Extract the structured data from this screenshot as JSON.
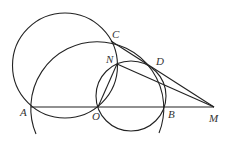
{
  "figure": {
    "type": "geometry-diagram",
    "stroke_color": "#222222",
    "label_color": "#333333",
    "points": {
      "A": {
        "label": "A",
        "x": 31,
        "y": 107,
        "lx": 20,
        "ly": 116
      },
      "O": {
        "label": "O",
        "x": 98,
        "y": 107,
        "lx": 92,
        "ly": 120
      },
      "B": {
        "label": "B",
        "x": 164,
        "y": 107,
        "lx": 168,
        "ly": 118
      },
      "M": {
        "label": "M",
        "x": 214,
        "y": 107,
        "lx": 209,
        "ly": 122
      },
      "C": {
        "label": "C",
        "x": 111,
        "y": 41,
        "lx": 112,
        "ly": 38
      },
      "N": {
        "label": "N",
        "x": 117,
        "y": 64,
        "lx": 106,
        "ly": 63
      },
      "D": {
        "label": "D",
        "x": 152,
        "y": 67,
        "lx": 156,
        "ly": 65
      }
    },
    "circles": [
      {
        "name": "circle-through-A-C-O",
        "cx": 65,
        "cy": 65.5,
        "r": 52.5
      },
      {
        "name": "circle-through-O-N-D-B",
        "cx": 131,
        "cy": 96,
        "r": 35
      }
    ],
    "arcs": [
      {
        "name": "arc-centered-O-through-A-C-D-B",
        "cx": 97.5,
        "cy": 107,
        "r": 66.5,
        "from": [
          36,
          134
        ],
        "to": [
          159,
          133
        ]
      }
    ],
    "segments": [
      {
        "name": "segment-A-M",
        "from": "A",
        "to": "M"
      },
      {
        "name": "segment-C-M",
        "from": "C",
        "to": "M"
      },
      {
        "name": "segment-N-M",
        "from": "N",
        "to": "M"
      },
      {
        "name": "segment-N-O",
        "from": "N",
        "to": "O"
      }
    ]
  }
}
